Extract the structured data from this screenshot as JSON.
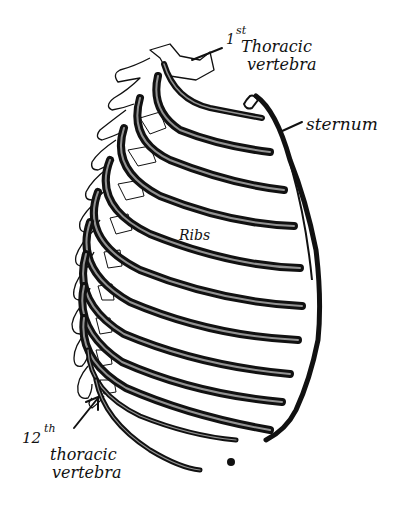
{
  "figure": {
    "ink_color": "#111111",
    "background_color": "#ffffff"
  },
  "labels": {
    "first_vertebra": {
      "ordinal_num": "1",
      "ordinal_suffix": "st",
      "line1": "Thoracic",
      "line2": "vertebra"
    },
    "sternum": {
      "text": "sternum"
    },
    "ribs": {
      "text": "Ribs"
    },
    "twelfth_vertebra": {
      "ordinal_num": "12",
      "ordinal_suffix": "th",
      "line1": "thoracic",
      "line2": "vertebra"
    }
  },
  "rib_count": 12
}
